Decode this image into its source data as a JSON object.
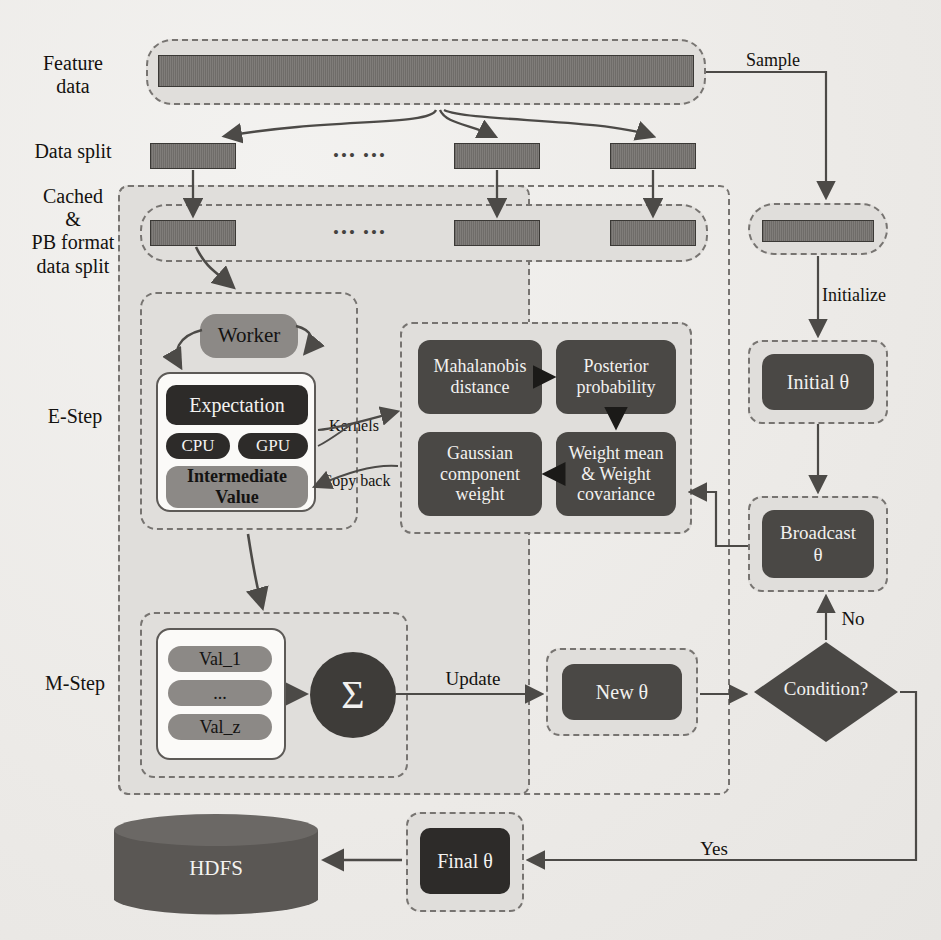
{
  "stage_labels": [
    {
      "id": "feature-data",
      "text": "Feature\ndata"
    },
    {
      "id": "data-split",
      "text": "Data split"
    },
    {
      "id": "cached-pb",
      "text": "Cached\n&\nPB format\ndata split"
    },
    {
      "id": "e-step",
      "text": "E-Step"
    },
    {
      "id": "m-step",
      "text": "M-Step"
    }
  ],
  "ellipsis": "••• •••",
  "worker": {
    "label": "Worker"
  },
  "expectation_block": {
    "expectation": "Expectation",
    "cpu": "CPU",
    "gpu": "GPU",
    "intermediate": "Intermediate\nValue"
  },
  "edge_labels": {
    "kernels": "Kernels",
    "copy_back": "Copy back",
    "sample": "Sample",
    "initialize": "Initialize",
    "update": "Update",
    "no": "No",
    "yes": "Yes"
  },
  "kernel_boxes": [
    {
      "id": "mahalanobis-distance",
      "text": "Mahalanobis\ndistance"
    },
    {
      "id": "posterior-probability",
      "text": "Posterior\nprobability"
    },
    {
      "id": "weight-mean-covariance",
      "text": "Weight mean\n& Weight\ncovariance"
    },
    {
      "id": "gaussian-component-weight",
      "text": "Gaussian\ncomponent\nweight"
    }
  ],
  "mstep_values": [
    {
      "id": "val-1",
      "text": "Val_1"
    },
    {
      "id": "val-dots",
      "text": "..."
    },
    {
      "id": "val-z",
      "text": "Val_z"
    }
  ],
  "sigma": {
    "symbol": "Σ"
  },
  "right_column": {
    "initial_theta": "Initial θ",
    "broadcast_theta": "Broadcast\nθ",
    "condition": "Condition?"
  },
  "bottom_row": {
    "new_theta": "New θ",
    "final_theta": "Final θ",
    "hdfs": "HDFS"
  },
  "colors": {
    "paper": "#efeeec",
    "container_fill": "#e0dedb",
    "dashed_stroke": "#777471",
    "dark_box": "#2d2b29",
    "gray_box": "#4a4845",
    "mid_box": "#8c8986",
    "wire": "#4c4a47",
    "white_panel": "#fbfaf8"
  }
}
